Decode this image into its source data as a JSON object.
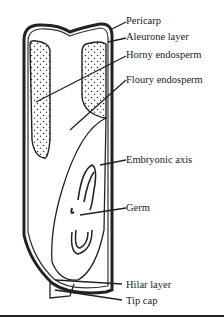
{
  "diagram": {
    "labels": [
      {
        "id": "pericarp",
        "text": "Pericarp"
      },
      {
        "id": "aleurone",
        "text": "Aleurone layer"
      },
      {
        "id": "horny",
        "text": "Horny endosperm"
      },
      {
        "id": "floury",
        "text": "Floury endosperm"
      },
      {
        "id": "embryonic",
        "text": "Embryonic axis"
      },
      {
        "id": "germ",
        "text": "Germ"
      },
      {
        "id": "hilar",
        "text": "Hilar layer"
      },
      {
        "id": "tipcap",
        "text": "Tip cap"
      }
    ],
    "colors": {
      "ink": "#222222",
      "background": "#ffffff"
    }
  }
}
